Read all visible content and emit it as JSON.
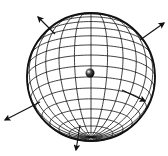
{
  "diagram": {
    "type": "wireframe-sphere",
    "background": "#ffffff",
    "stroke": "#111111",
    "sphere": {
      "cx": 91,
      "cy": 77,
      "r": 64,
      "tilt": 0.35,
      "latitudes": 18,
      "longitudes": 24
    },
    "center_point": {
      "cx": 90,
      "cy": 73,
      "r": 4.5
    },
    "arrows": [
      {
        "name": "arrow-upper-left",
        "x1": 55,
        "y1": 34,
        "x2": 38,
        "y2": 17
      },
      {
        "name": "arrow-upper-right",
        "x1": 140,
        "y1": 40,
        "x2": 164,
        "y2": 23
      },
      {
        "name": "arrow-right",
        "x1": 122,
        "y1": 90,
        "x2": 145,
        "y2": 101
      },
      {
        "name": "arrow-lower-left",
        "x1": 40,
        "y1": 102,
        "x2": 5,
        "y2": 120
      },
      {
        "name": "arrow-bottom",
        "x1": 80,
        "y1": 125,
        "x2": 76,
        "y2": 150
      }
    ]
  }
}
